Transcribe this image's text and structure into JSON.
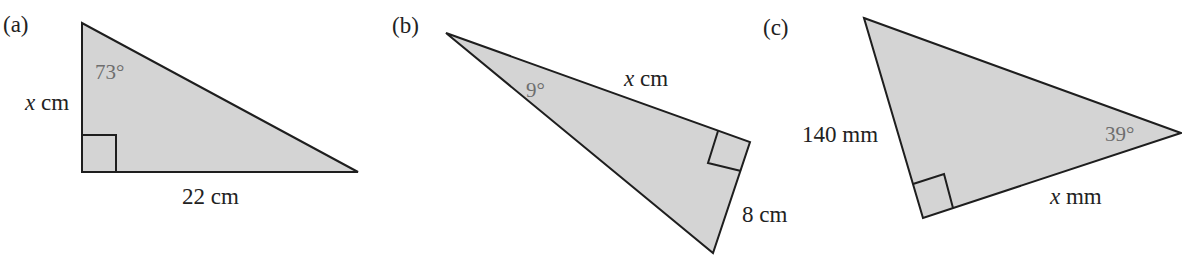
{
  "figure": {
    "fill_color": "#d4d4d4",
    "stroke_color": "#1e1e1e",
    "panels": [
      {
        "id": "a",
        "label": "(a)",
        "angle": "73°",
        "side_label_var": "x",
        "side_label_unit": " cm",
        "base_label": "22 cm"
      },
      {
        "id": "b",
        "label": "(b)",
        "angle": "9°",
        "hyp_label_var": "x",
        "hyp_label_unit": " cm",
        "side_label": "8 cm"
      },
      {
        "id": "c",
        "label": "(c)",
        "angle": "39°",
        "side_label": "140 mm",
        "base_label_var": "x",
        "base_label_unit": " mm"
      }
    ]
  }
}
